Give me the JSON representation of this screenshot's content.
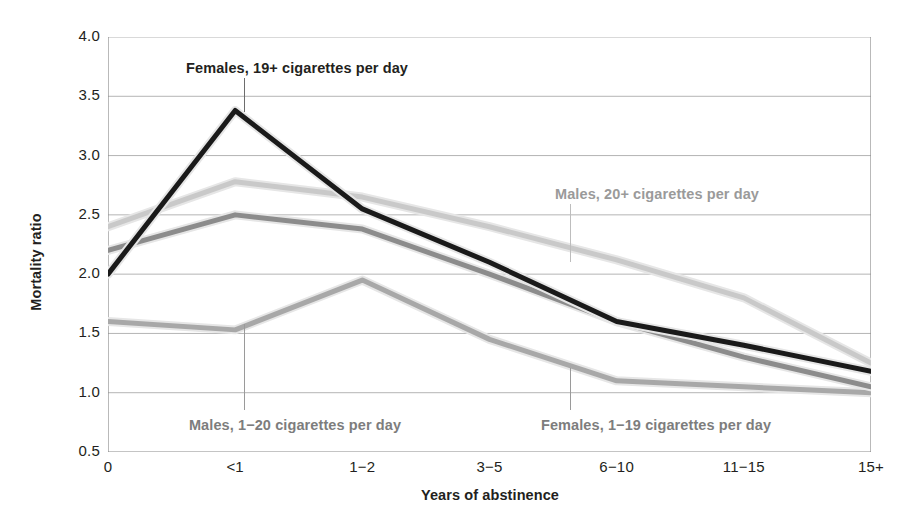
{
  "chart_data": {
    "type": "line",
    "title": "",
    "xlabel": "Years of abstinence",
    "ylabel": "Mortality ratio",
    "categories": [
      "0",
      "<1",
      "1−2",
      "3−5",
      "6−10",
      "11−15",
      "15+"
    ],
    "ylim": [
      0.5,
      4.0
    ],
    "yticks": [
      "0.5",
      "1.0",
      "1.5",
      "2.0",
      "2.5",
      "3.0",
      "3.5",
      "4.0"
    ],
    "ytick_values": [
      0.5,
      1.0,
      1.5,
      2.0,
      2.5,
      3.0,
      3.5,
      4.0
    ],
    "grid": true,
    "legend_position": "inline-annotations",
    "series": [
      {
        "name": "Females, 19+ cigarettes per day",
        "color": "#1a1a1a",
        "values": [
          2.0,
          3.38,
          2.55,
          2.1,
          1.6,
          1.4,
          1.18
        ]
      },
      {
        "name": "Males, 20+ cigarettes per day",
        "color": "#c9c9c9",
        "values": [
          2.4,
          2.78,
          2.65,
          2.4,
          2.12,
          1.8,
          1.25
        ]
      },
      {
        "name": "Males, 1−20 cigarettes per day",
        "color": "#8c8c8c",
        "values": [
          2.2,
          2.5,
          2.38,
          2.0,
          1.6,
          1.3,
          1.05
        ]
      },
      {
        "name": "Females, 1−19 cigarettes per day",
        "color": "#a8a8a8",
        "values": [
          1.6,
          1.53,
          1.95,
          1.45,
          1.1,
          1.05,
          1.0
        ]
      }
    ],
    "annotations": [
      {
        "text": "Females, 19+ cigarettes per day",
        "color": "#231f20",
        "x": 297,
        "y": 60,
        "align": "center",
        "leader": {
          "x": 244,
          "y_top": 78,
          "y_bottom": 112,
          "color": "#6d6d6d"
        }
      },
      {
        "text": "Males, 20+ cigarettes per day",
        "color": "#9a9a9a",
        "x": 657,
        "y": 186,
        "align": "center",
        "leader": {
          "x": 570,
          "y_top": 204,
          "y_bottom": 262,
          "color": "#bdbdbd"
        }
      },
      {
        "text": "Males, 1−20 cigarettes per day",
        "color": "#7d7d7d",
        "x": 295,
        "y": 417,
        "align": "center",
        "leader": {
          "x": 244,
          "y_top": 324,
          "y_bottom": 410,
          "color": "#9a9a9a"
        }
      },
      {
        "text": "Females, 1−19 cigarettes per day",
        "color": "#7d7d7d",
        "x": 656,
        "y": 417,
        "align": "center",
        "leader": {
          "x": 570,
          "y_top": 368,
          "y_bottom": 410,
          "color": "#9a9a9a"
        }
      }
    ],
    "style": {
      "axis_color": "#8a8a8a",
      "grid_color": "#b4b4b4",
      "background": "#ffffff",
      "line_width": 5,
      "halo_width": 9,
      "halo_color": "#e6e6e6"
    }
  }
}
